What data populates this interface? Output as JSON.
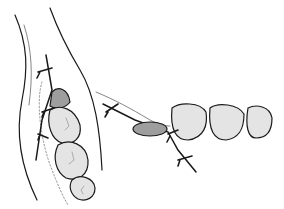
{
  "figure": {
    "colors": {
      "line": "#1a1a1a",
      "tooth_fill": "#e4e4e4",
      "tooth_detail": "#9a9a9a",
      "graft_fill": "#9e9e9e",
      "background": "#ffffff"
    },
    "views": [
      {
        "name": "occlusal-view",
        "teeth_count": 3,
        "graft": true,
        "sutures": 3
      },
      {
        "name": "buccal-view",
        "teeth_count": 3,
        "graft": true,
        "sutures": 3
      }
    ]
  }
}
